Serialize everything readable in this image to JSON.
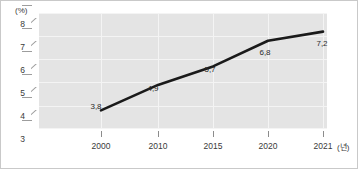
{
  "chart_data": {
    "type": "line",
    "title": "",
    "xlabel": "(년)",
    "ylabel": "(%)",
    "categories": [
      "2000",
      "2010",
      "2015",
      "2020",
      "2021"
    ],
    "values": [
      3.8,
      4.9,
      5.7,
      6.8,
      7.2
    ],
    "point_labels": [
      "3,8",
      "4,9",
      "5,7",
      "6,8",
      "7,2"
    ],
    "series": [
      {
        "name": "",
        "values": [
          3.8,
          4.9,
          5.7,
          6.8,
          7.2
        ],
        "color": "#1a1a1a"
      }
    ],
    "ylim": [
      3,
      8
    ],
    "yticks": [
      3,
      4,
      5,
      6,
      7,
      8
    ],
    "ytick_labels": [
      "3",
      "4",
      "5",
      "6",
      "7",
      "8"
    ],
    "xtick_labels": [
      "2000",
      "2010",
      "2015",
      "2020",
      "2021"
    ],
    "grid": true,
    "legend": false,
    "legend_position": "none",
    "plot_background": "#e4e4e4",
    "gridline_color": "#f4f4f4",
    "axis_color": "#9d9d9d",
    "line_color": "#1a1a1a",
    "frame_border_color": "#c9c9c9"
  }
}
